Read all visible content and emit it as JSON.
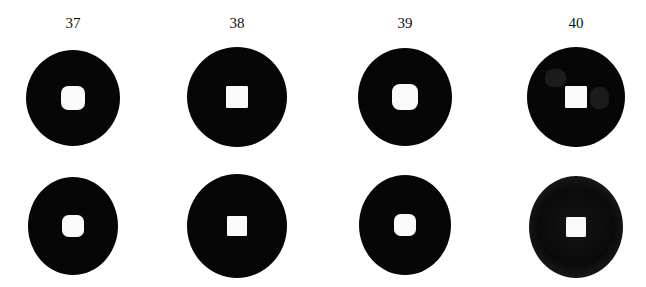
{
  "figure": {
    "type": "coin specimen plate",
    "rows": [
      "obverse",
      "reverse"
    ],
    "colors": {
      "coin": "#060606",
      "hole": "#fafafa",
      "background": "#ffffff"
    },
    "specimens": [
      {
        "number": "37",
        "label_x": 73,
        "obverse": {
          "cx": 73,
          "cy": 98,
          "rx": 47,
          "ry": 48,
          "hole": 24,
          "hole_shape": "rounded"
        },
        "reverse": {
          "cx": 73,
          "cy": 226,
          "rx": 45,
          "ry": 49,
          "hole": 22,
          "hole_shape": "rounded"
        }
      },
      {
        "number": "38",
        "label_x": 237,
        "obverse": {
          "cx": 237,
          "cy": 97,
          "rx": 50,
          "ry": 50,
          "hole": 22,
          "hole_shape": "square"
        },
        "reverse": {
          "cx": 237,
          "cy": 226,
          "rx": 50,
          "ry": 52,
          "hole": 20,
          "hole_shape": "square"
        }
      },
      {
        "number": "39",
        "label_x": 405,
        "obverse": {
          "cx": 405,
          "cy": 97,
          "rx": 47,
          "ry": 49,
          "hole": 26,
          "hole_shape": "rounded"
        },
        "reverse": {
          "cx": 405,
          "cy": 225,
          "rx": 46,
          "ry": 50,
          "hole": 22,
          "hole_shape": "rounded"
        }
      },
      {
        "number": "40",
        "label_x": 576,
        "obverse": {
          "cx": 576,
          "cy": 97,
          "rx": 49,
          "ry": 50,
          "hole": 22,
          "hole_shape": "square",
          "inscribed": true
        },
        "reverse": {
          "cx": 576,
          "cy": 227,
          "rx": 47,
          "ry": 51,
          "hole": 20,
          "hole_shape": "square",
          "worn": true
        }
      }
    ]
  }
}
